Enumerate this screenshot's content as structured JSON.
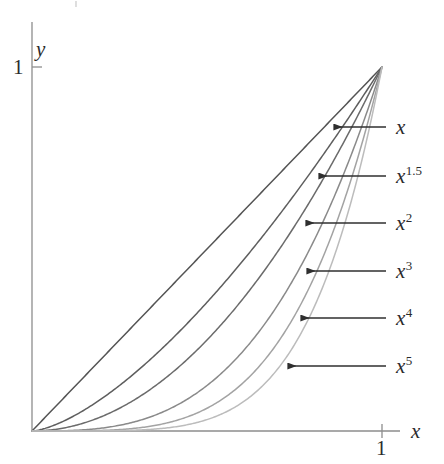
{
  "chart_data": {
    "type": "line",
    "title": "",
    "xlabel": "x",
    "ylabel": "y",
    "xlim": [
      0,
      1.09
    ],
    "ylim": [
      0,
      1.0
    ],
    "xticks": [
      {
        "value": 1,
        "label": "1"
      }
    ],
    "yticks": [
      {
        "value": 1,
        "label": "1"
      }
    ],
    "grid": false,
    "legend": "annotations-right",
    "x": [
      0,
      0.05,
      0.1,
      0.15,
      0.2,
      0.25,
      0.3,
      0.35,
      0.4,
      0.45,
      0.5,
      0.55,
      0.6,
      0.65,
      0.7,
      0.75,
      0.8,
      0.85,
      0.9,
      0.95,
      1.0
    ],
    "series": [
      {
        "name": "x",
        "exponent": 1,
        "label": "x",
        "color": "#545454",
        "values": [
          0,
          0.05,
          0.1,
          0.15,
          0.2,
          0.25,
          0.3,
          0.35,
          0.4,
          0.45,
          0.5,
          0.55,
          0.6,
          0.65,
          0.7,
          0.75,
          0.8,
          0.85,
          0.9,
          0.95,
          1.0
        ]
      },
      {
        "name": "x^1.5",
        "exponent": 1.5,
        "label": "x",
        "superscript": "1.5",
        "color": "#5e5e5e",
        "values": [
          0,
          0.011,
          0.032,
          0.058,
          0.089,
          0.125,
          0.164,
          0.207,
          0.253,
          0.302,
          0.354,
          0.408,
          0.465,
          0.524,
          0.586,
          0.65,
          0.716,
          0.784,
          0.854,
          0.926,
          1.0
        ]
      },
      {
        "name": "x^2",
        "exponent": 2,
        "label": "x",
        "superscript": "2",
        "color": "#6b6b6b",
        "values": [
          0,
          0.0025,
          0.01,
          0.0225,
          0.04,
          0.0625,
          0.09,
          0.1225,
          0.16,
          0.2025,
          0.25,
          0.3025,
          0.36,
          0.4225,
          0.49,
          0.5625,
          0.64,
          0.7225,
          0.81,
          0.9025,
          1.0
        ]
      },
      {
        "name": "x^3",
        "exponent": 3,
        "label": "x",
        "superscript": "3",
        "color": "#8a8a8a",
        "values": [
          0,
          0.000125,
          0.001,
          0.003375,
          0.008,
          0.015625,
          0.027,
          0.042875,
          0.064,
          0.091125,
          0.125,
          0.166375,
          0.216,
          0.274625,
          0.343,
          0.421875,
          0.512,
          0.614125,
          0.729,
          0.857375,
          1.0
        ]
      },
      {
        "name": "x^4",
        "exponent": 4,
        "label": "x",
        "superscript": "4",
        "color": "#a3a3a3",
        "values": [
          0,
          6.25e-06,
          0.0001,
          0.00050625,
          0.0016,
          0.00390625,
          0.0081,
          0.01500625,
          0.0256,
          0.04100625,
          0.0625,
          0.09150625,
          0.1296,
          0.17850625,
          0.2401,
          0.31640625,
          0.4096,
          0.52200625,
          0.6561,
          0.81450625,
          1.0
        ]
      },
      {
        "name": "x^5",
        "exponent": 5,
        "label": "x",
        "superscript": "5",
        "color": "#bcbcbc",
        "values": [
          0,
          3e-07,
          1e-05,
          7.59e-05,
          0.00032,
          0.0009766,
          0.00243,
          0.0052522,
          0.01024,
          0.0184528,
          0.03125,
          0.0503284,
          0.07776,
          0.1160291,
          0.16807,
          0.2373047,
          0.32768,
          0.4437053,
          0.59049,
          0.7737809,
          1.0
        ]
      }
    ],
    "annotations": [
      {
        "target": "x",
        "label": "x",
        "superscript": "",
        "arrow_y": 127,
        "arrow_tip_x": 334,
        "arrow_tail_x": 386
      },
      {
        "target": "x^1.5",
        "label": "x",
        "superscript": "1.5",
        "arrow_y": 176,
        "arrow_tip_x": 319,
        "arrow_tail_x": 386
      },
      {
        "target": "x^2",
        "label": "x",
        "superscript": "2",
        "arrow_y": 223,
        "arrow_tip_x": 306,
        "arrow_tail_x": 386
      },
      {
        "target": "x^3",
        "label": "x",
        "superscript": "3",
        "arrow_y": 271,
        "arrow_tip_x": 307,
        "arrow_tail_x": 386
      },
      {
        "target": "x^4",
        "label": "x",
        "superscript": "4",
        "arrow_y": 318,
        "arrow_tip_x": 301,
        "arrow_tail_x": 386
      },
      {
        "target": "x^5",
        "label": "x",
        "superscript": "5",
        "arrow_y": 366,
        "arrow_tip_x": 288,
        "arrow_tail_x": 386
      }
    ],
    "axes": {
      "x_axis_label": "x",
      "y_axis_label": "y",
      "x_tick_label": "1",
      "y_tick_label": "1",
      "axis_color": "#8d8d8d",
      "arrow_color": "#2f2f2f",
      "text_color": "#2b2b2b"
    }
  },
  "geometry": {
    "origin_x": 32,
    "origin_y": 431,
    "unit_x_px": 382,
    "unit_y_px": 67,
    "x_axis_end": 400,
    "y_axis_top": 22
  },
  "labels": {
    "y_axis_name": "y",
    "y_one": "1",
    "x_axis_name": "x",
    "x_one": "1",
    "curve_1": "x",
    "curve_15_base": "x",
    "curve_15_sup": "1.5",
    "curve_2_base": "x",
    "curve_2_sup": "2",
    "curve_3_base": "x",
    "curve_3_sup": "3",
    "curve_4_base": "x",
    "curve_4_sup": "4",
    "curve_5_base": "x",
    "curve_5_sup": "5"
  }
}
